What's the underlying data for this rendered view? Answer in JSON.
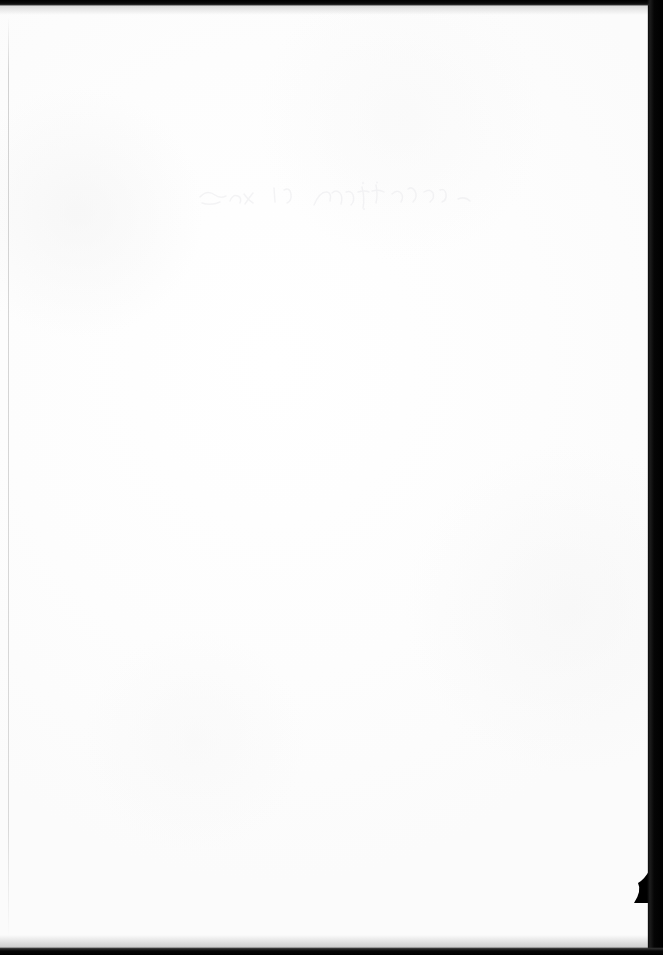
{
  "page": {
    "kind": "scanned-blank-sheet",
    "width": 663,
    "height": 955,
    "paper_color": "#fefefe",
    "scanner_background_color": "#000000"
  },
  "marks": {
    "ghost_text": {
      "legible": false,
      "transcription": "",
      "note": "faint illegible bleed-through of handwritten script",
      "ink_color": "#e6e6e8",
      "left": 196,
      "top": 176,
      "width": 285,
      "height": 32
    },
    "margin_rule": {
      "color": "#c4c4c4",
      "orientation": "vertical",
      "left": 8
    },
    "corner_tear": {
      "location": "bottom-right",
      "color": "#000000"
    }
  },
  "edges": {
    "top_band_color": "#000000",
    "right_band_color": "#000000",
    "bottom_band_color": "#000000"
  }
}
